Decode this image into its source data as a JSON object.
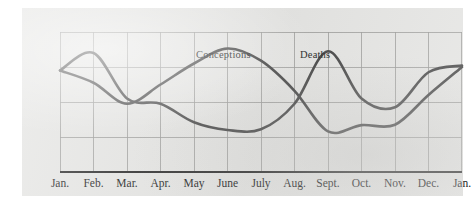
{
  "chart_data": {
    "type": "line",
    "title": "",
    "subtitle": "",
    "xlabel": "",
    "ylabel": "",
    "grid": true,
    "legend_position": "inline-annotation",
    "xlim": [
      0,
      12
    ],
    "ylim": [
      0,
      4
    ],
    "y_gridlines": [
      0,
      1,
      2,
      3,
      4
    ],
    "y_tick_labels": [],
    "x_gridlines": [
      0,
      1,
      2,
      3,
      4,
      5,
      6,
      7,
      8,
      9,
      10,
      11,
      12
    ],
    "categories": [
      "Jan.",
      "Feb.",
      "Mar.",
      "Apr.",
      "May",
      "June",
      "July",
      "Aug.",
      "Sept.",
      "Oct.",
      "Nov.",
      "Dec.",
      "Jan."
    ],
    "annotations": [
      {
        "text": "Conceptions",
        "x": 5.0,
        "y": 3.6
      },
      {
        "text": "Deaths",
        "x": 8.1,
        "y": 3.6
      }
    ],
    "series": [
      {
        "name": "Conceptions",
        "color": "#4a4a4a",
        "values": [
          2.9,
          2.55,
          1.95,
          2.5,
          3.1,
          3.53,
          3.18,
          2.32,
          1.16,
          1.34,
          1.35,
          2.2,
          3.0
        ]
      },
      {
        "name": "Deaths",
        "color": "#4a4a4a",
        "values": [
          2.9,
          3.4,
          2.1,
          1.95,
          1.42,
          1.2,
          1.22,
          1.95,
          3.45,
          2.1,
          1.85,
          2.85,
          3.04
        ]
      }
    ]
  },
  "figure": {
    "panel_color": "#e4e4e2",
    "line_color": "#4a4a4a",
    "grid_color": "#9a9a99",
    "axis_color": "#2d2d2d",
    "caption_conceptions": "Conceptions",
    "caption_deaths": "Deaths"
  },
  "x_axis": {
    "labels": [
      "Jan.",
      "Feb.",
      "Mar.",
      "Apr.",
      "May",
      "June",
      "July",
      "Aug.",
      "Sept.",
      "Oct.",
      "Nov.",
      "Dec.",
      "Jan."
    ]
  }
}
